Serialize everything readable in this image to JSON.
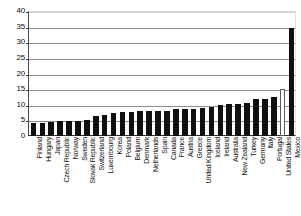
{
  "chart_data": {
    "type": "bar",
    "title": "",
    "subtitle": "",
    "xlabel": "",
    "ylabel": "",
    "ylim": [
      0,
      40
    ],
    "ytick_step": 5,
    "yticks": [
      0,
      5,
      10,
      15,
      20,
      25,
      30,
      35,
      40
    ],
    "grid": true,
    "legend": "none",
    "categories": [
      "Finland",
      "Hungary",
      "Japan",
      "Czech Republic",
      "Norway",
      "Sweden",
      "Slovak Republic",
      "Switzerland",
      "Luxembourg",
      "Korea",
      "Poland",
      "Belgium",
      "Denmark",
      "Netherlands",
      "Spain",
      "Canada",
      "France",
      "Austria",
      "Greece",
      "United Kingdom",
      "Iceland",
      "Ireland",
      "Australia",
      "New Zealand",
      "Turkey",
      "Germany",
      "Italy",
      "Portugal",
      "United States",
      "Mexico"
    ],
    "values": [
      4.3,
      4.3,
      4.5,
      4.7,
      4.8,
      4.9,
      5.0,
      6.4,
      6.8,
      7.3,
      7.6,
      7.8,
      7.9,
      8.0,
      8.0,
      8.1,
      8.6,
      8.8,
      8.8,
      8.9,
      9.4,
      9.8,
      10.1,
      10.2,
      10.5,
      11.8,
      12.0,
      12.6,
      15.0,
      34.5
    ],
    "bar_styles": [
      "filled",
      "filled",
      "filled",
      "filled",
      "filled",
      "filled",
      "filled",
      "filled",
      "filled",
      "filled",
      "filled",
      "filled",
      "filled",
      "filled",
      "filled",
      "filled",
      "filled",
      "filled",
      "filled",
      "filled",
      "filled",
      "filled",
      "filled",
      "filled",
      "filled",
      "filled",
      "filled",
      "filled",
      "hollow",
      "filled"
    ],
    "colors": {
      "bar_fill": "#101010",
      "bar_hollow_fill": "#ffffff",
      "bar_hollow_stroke": "#5a5a5a",
      "gridline": "#8c8c8c",
      "axis": "#2b2b2b",
      "text": "#101010",
      "background": "#ffffff"
    }
  }
}
